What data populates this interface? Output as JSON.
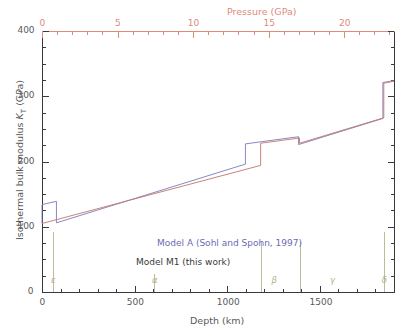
{
  "chart_data": {
    "type": "line",
    "title": "",
    "xlabel": "Depth (km)",
    "ylabel": "Isothermal bulk modulus K_T (GPa)",
    "x2label": "Pressure (GPa)",
    "xlim": [
      0,
      1900
    ],
    "ylim": [
      0,
      400
    ],
    "x2lim": [
      0,
      23.3
    ],
    "xticks": [
      0,
      500,
      1000,
      1500
    ],
    "xticklabels": [
      "0",
      "500",
      "1000",
      "1500"
    ],
    "yticks": [
      0,
      100,
      200,
      300,
      400
    ],
    "yticklabels": [
      "0",
      "100",
      "200",
      "300",
      "400"
    ],
    "x2ticks": [
      0,
      5,
      10,
      15,
      20
    ],
    "x2ticklabels": [
      "0",
      "5",
      "10",
      "15",
      "20"
    ],
    "grid": false,
    "legend_position": "center-left",
    "series": [
      {
        "name": "Model A (Sohl and Spohn, 1997)",
        "color": "#7b7bc0",
        "points": [
          [
            0,
            105
          ],
          [
            0,
            134
          ],
          [
            78,
            139
          ],
          [
            78,
            106
          ],
          [
            1098,
            196
          ],
          [
            1098,
            227
          ],
          [
            1385,
            238
          ],
          [
            1385,
            226
          ],
          [
            1840,
            266
          ],
          [
            1840,
            321
          ],
          [
            1900,
            324
          ]
        ]
      },
      {
        "name": "Model M1 (this work)",
        "color": "#c4756a",
        "points": [
          [
            0,
            105
          ],
          [
            1180,
            194
          ],
          [
            1180,
            228
          ],
          [
            1390,
            236
          ],
          [
            1390,
            228
          ],
          [
            1845,
            267
          ],
          [
            1845,
            320
          ],
          [
            1900,
            323
          ]
        ]
      }
    ],
    "annotations": [
      {
        "label": "ε",
        "x": 60,
        "text": "epsilon"
      },
      {
        "label": "α",
        "x": 605,
        "text": "alpha"
      },
      {
        "label": "β",
        "x": 1250,
        "text": "beta"
      },
      {
        "label": "γ",
        "x": 1565,
        "text": "gamma"
      },
      {
        "label": "δ",
        "x": 1845,
        "text": "delta"
      }
    ],
    "phase_lines": [
      {
        "x": 60,
        "top": 0,
        "height": 60
      },
      {
        "x": 605,
        "top": 0,
        "height": 18
      },
      {
        "x": 1180,
        "top": 0,
        "height": 50
      },
      {
        "x": 1390,
        "top": 0,
        "height": 50
      },
      {
        "x": 1845,
        "top": 0,
        "height": 60
      }
    ],
    "colors": {
      "model_a": "#7b7bc0",
      "model_m1": "#c4756a",
      "pressure_axis": "#e08a7a",
      "text": "#5a5a5a",
      "phase_marker": "#b5b08a"
    }
  },
  "axes": {
    "x_title": "Depth (km)",
    "y_title_pre": "Isothermal bulk modulus ",
    "y_title_italic": "K",
    "y_title_sub": "T",
    "y_title_post": " (GPa)",
    "x2_title": "Pressure (GPa)"
  },
  "legend": {
    "model_a": "Model A (Sohl and Spohn, 1997)",
    "model_m1": "Model M1 (this work)"
  },
  "ticks": {
    "x": [
      "0",
      "500",
      "1000",
      "1500"
    ],
    "y": [
      "0",
      "100",
      "200",
      "300",
      "400"
    ],
    "x2": [
      "0",
      "5",
      "10",
      "15",
      "20"
    ]
  },
  "phase_labels": {
    "epsilon": "ε",
    "alpha": "α",
    "beta": "β",
    "gamma": "γ",
    "delta": "δ"
  }
}
